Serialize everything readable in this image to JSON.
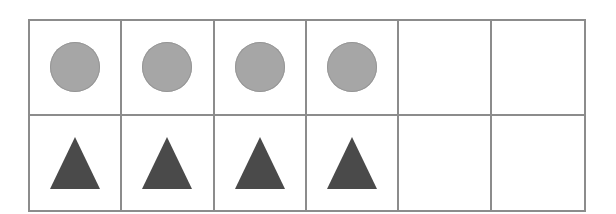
{
  "frame": {
    "columns": 6,
    "rows": 2,
    "border_color": "#8c8c8c"
  },
  "rows": [
    {
      "shape": "circle",
      "color": "#a6a6a6",
      "cells": [
        "circle",
        "circle",
        "circle",
        "circle",
        "empty",
        "empty"
      ]
    },
    {
      "shape": "triangle",
      "color": "#4a4a4a",
      "cells": [
        "triangle",
        "triangle",
        "triangle",
        "triangle",
        "empty",
        "empty"
      ]
    }
  ],
  "summary": {
    "circles": 4,
    "triangles": 4,
    "empty_cells": 4
  }
}
